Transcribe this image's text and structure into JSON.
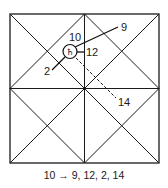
{
  "diagram": {
    "type": "north-indian-horoscope-chart",
    "caption": "10 → 9, 12, 2, 14",
    "planet": {
      "house": "10",
      "glyph_name": "saturn-icon",
      "glyph": "♄"
    },
    "aspects": [
      {
        "target": "9",
        "style": "solid"
      },
      {
        "target": "12",
        "style": "solid"
      },
      {
        "target": "2",
        "style": "solid"
      },
      {
        "target": "14",
        "style": "dashed"
      }
    ],
    "labels": {
      "source": "10",
      "a9": "9",
      "a12": "12",
      "a2": "2",
      "a14": "14"
    },
    "colors": {
      "line": "#111111",
      "background": "#ffffff"
    }
  }
}
